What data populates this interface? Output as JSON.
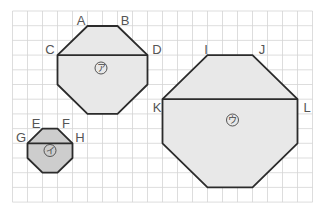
{
  "grid": {
    "x0": 12.5,
    "y0": 11,
    "dx": 15,
    "dy": 14.7,
    "cols": 20,
    "rows": 13,
    "line_color": "#d4d4d4"
  },
  "colors": {
    "stroke": "#2b2b2b",
    "fill_large": "#e8e8e8",
    "fill_small": "#cdcdcd"
  },
  "shapes": [
    {
      "id": "a",
      "symbol": "ア",
      "labels": {
        "A": "A",
        "B": "B",
        "C": "C",
        "D": "D"
      },
      "description": "octagon, 6x6 cells, diagonal CD"
    },
    {
      "id": "i",
      "symbol": "イ",
      "labels": {
        "E": "E",
        "F": "F",
        "G": "G",
        "H": "H"
      },
      "description": "octagon, 3x3 cells, diagonal GH"
    },
    {
      "id": "u",
      "symbol": "ウ",
      "labels": {
        "I": "I",
        "J": "J",
        "K": "K",
        "L": "L"
      },
      "description": "octagon, 9x9 cells, diagonal KL"
    }
  ]
}
